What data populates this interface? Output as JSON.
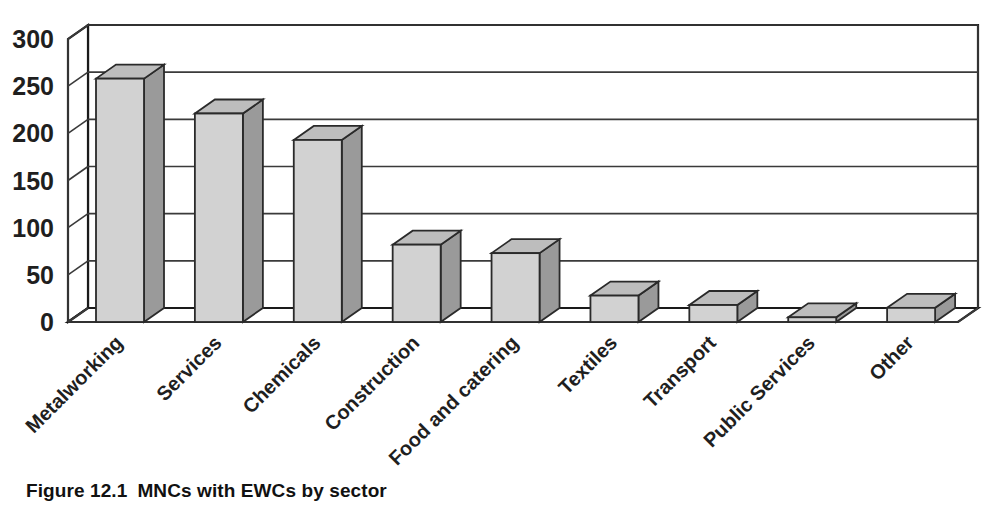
{
  "caption": {
    "figure_number": "Figure 12.1",
    "title": "MNCs with EWCs by sector"
  },
  "chart_data": {
    "type": "bar",
    "title": "MNCs with EWCs by sector",
    "subtitle": "",
    "xlabel": "",
    "ylabel": "",
    "ylim": [
      0,
      300
    ],
    "ytick_values": [
      0,
      50,
      100,
      150,
      200,
      250,
      300
    ],
    "ytick_labels": [
      "0",
      "50",
      "100",
      "150",
      "200",
      "250",
      "300"
    ],
    "grid": true,
    "legend": false,
    "legend_position": "none",
    "style": "3d-column",
    "categories": [
      "Metalworking",
      "Services",
      "Chemicals",
      "Construction",
      "Food and catering",
      "Textiles",
      "Transport",
      "Public Services",
      "Other"
    ],
    "values": [
      258,
      221,
      193,
      82,
      73,
      28,
      18,
      5,
      15
    ],
    "series": [
      {
        "name": "MNCs with EWCs",
        "values": [
          258,
          221,
          193,
          82,
          73,
          28,
          18,
          5,
          15
        ]
      }
    ],
    "colors": {
      "bar_front": "#d2d2d2",
      "bar_side": "#9a9a9a",
      "bar_top": "#bdbdbd",
      "outline": "#2a2a2a",
      "gridline": "#3a3a3a",
      "background": "#ffffff",
      "text": "#1f1f1f"
    }
  }
}
